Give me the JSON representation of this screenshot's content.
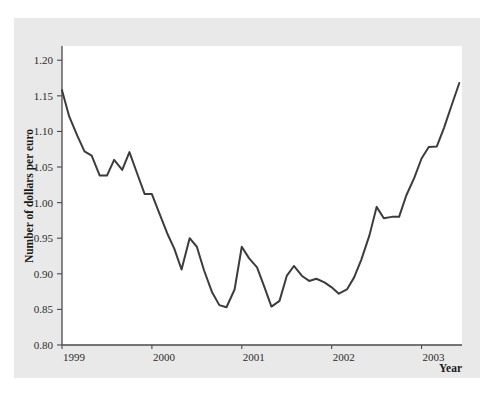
{
  "figure": {
    "background_color": "#ffffff",
    "panel_color": "#e9e9e9",
    "plot_area_color": "#ffffff",
    "axis_color": "#4a4a4a",
    "line_color": "#3c3c3c"
  },
  "labels": {
    "ylabel": "Number of dollars per euro",
    "xlabel": "Year"
  },
  "chart_data": {
    "type": "line",
    "title": "",
    "xlabel": "Year",
    "ylabel": "Number of dollars per euro",
    "xlim": [
      1999.0,
      2003.45
    ],
    "ylim": [
      0.8,
      1.22
    ],
    "grid": false,
    "legend": null,
    "xticks": [
      1999,
      2000,
      2001,
      2002,
      2003
    ],
    "xtick_labels": [
      "1999",
      "2000",
      "2001",
      "2002",
      "2003"
    ],
    "yticks": [
      0.8,
      0.85,
      0.9,
      0.95,
      1.0,
      1.05,
      1.1,
      1.15,
      1.2
    ],
    "ytick_labels": [
      "0.80",
      "0.85",
      "0.90",
      "0.95",
      "1.00",
      "1.05",
      "1.10",
      "1.15",
      "1.20"
    ],
    "series": [
      {
        "name": "USD per EUR exchange rate",
        "color": "#3c3c3c",
        "x": [
          1999.0,
          1999.08,
          1999.17,
          1999.25,
          1999.33,
          1999.42,
          1999.5,
          1999.58,
          1999.67,
          1999.75,
          1999.83,
          1999.92,
          2000.0,
          2000.08,
          2000.17,
          2000.25,
          2000.33,
          2000.42,
          2000.5,
          2000.58,
          2000.67,
          2000.75,
          2000.83,
          2000.92,
          2001.0,
          2001.08,
          2001.17,
          2001.25,
          2001.33,
          2001.42,
          2001.5,
          2001.58,
          2001.67,
          2001.75,
          2001.83,
          2001.92,
          2002.0,
          2002.08,
          2002.17,
          2002.25,
          2002.33,
          2002.42,
          2002.5,
          2002.58,
          2002.67,
          2002.75,
          2002.83,
          2002.92,
          2003.0,
          2003.08,
          2003.17,
          2003.25,
          2003.33,
          2003.42
        ],
        "y": [
          1.158,
          1.121,
          1.094,
          1.072,
          1.066,
          1.038,
          1.038,
          1.06,
          1.046,
          1.071,
          1.043,
          1.012,
          1.012,
          0.986,
          0.957,
          0.935,
          0.906,
          0.95,
          0.938,
          0.905,
          0.874,
          0.856,
          0.853,
          0.878,
          0.938,
          0.922,
          0.909,
          0.882,
          0.854,
          0.862,
          0.897,
          0.911,
          0.897,
          0.89,
          0.893,
          0.888,
          0.881,
          0.872,
          0.878,
          0.895,
          0.92,
          0.954,
          0.994,
          0.978,
          0.98,
          0.98,
          1.01,
          1.035,
          1.062,
          1.078,
          1.079,
          1.105,
          1.135,
          1.168
        ]
      }
    ]
  }
}
